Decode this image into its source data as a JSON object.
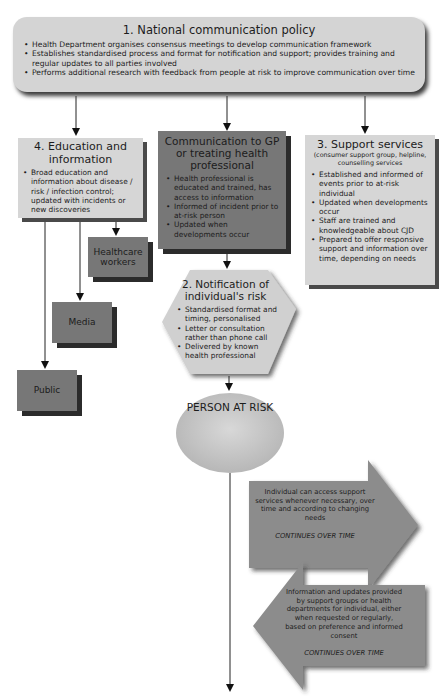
{
  "policy": {
    "title": "1. National communication policy",
    "items": [
      "Health Department organises consensus meetings to develop communication framework",
      "Establishes standardised process and format for notification and support; provides training and regular updates to all parties involved",
      "Performs additional research with feedback from people at risk to improve communication over time"
    ]
  },
  "education": {
    "title": "4. Education and information",
    "items": [
      "Broad education and information about disease / risk / infection control; updated with incidents or new discoveries"
    ]
  },
  "gp": {
    "title": "Communication to GP or treating health professional",
    "items": [
      "Health professional is educated and trained, has access to information",
      "Informed of incident prior to at-risk person",
      "Updated when developments occur"
    ]
  },
  "support": {
    "title": "3. Support services",
    "subtitle": "(consumer support group, helpline, counselling services",
    "items": [
      "Established and informed of events prior to at-risk individual",
      "Updated when developments occur",
      "Staff are trained and knowledgeable about CJD",
      "Prepared to offer responsive support and information over time, depending on needs"
    ]
  },
  "audiences": {
    "healthcare": "Healthcare workers",
    "media": "Media",
    "public": "Public"
  },
  "notification": {
    "title": "2. Notification of individual's risk",
    "items": [
      "Standardised format and timing, personalised",
      "Letter or consultation rather than phone call",
      "Delivered by known health professional"
    ]
  },
  "person": {
    "label": "PERSON AT RISK"
  },
  "arrow_right": {
    "text": "Individual can access support services whenever necessary, over time and according to changing needs",
    "footer": "CONTINUES OVER TIME"
  },
  "arrow_left": {
    "text": "Information and updates provided by support groups or health departments for individual, either when requested or regularly, based on preference and informed consent",
    "footer": "CONTINUES OVER TIME"
  },
  "colors": {
    "light_box": "#d6d6d6",
    "dark_box": "#777777",
    "arrow_fill": "#8a8a8a",
    "shadow": "#2b2b2b"
  }
}
